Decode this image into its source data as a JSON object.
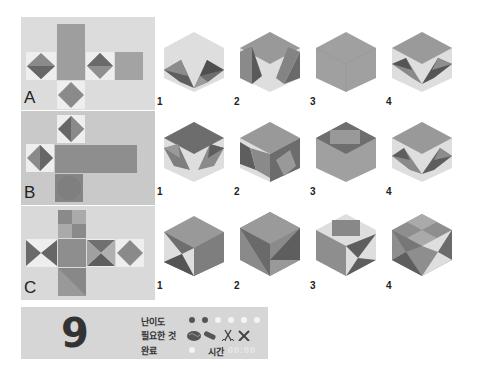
{
  "puzzles": [
    {
      "label": "A",
      "options": [
        "1",
        "2",
        "3",
        "4"
      ]
    },
    {
      "label": "B",
      "options": [
        "1",
        "2",
        "3",
        "4"
      ]
    },
    {
      "label": "C",
      "options": [
        "1",
        "2",
        "3",
        "4"
      ]
    }
  ],
  "info": {
    "number": "9",
    "difficulty_label": "난이도",
    "difficulty_filled": 2,
    "difficulty_total": 6,
    "required_label": "필요한 것",
    "required_items": [
      "brain-icon",
      "pencil-icon",
      "scissors-icon",
      "tools-icon"
    ],
    "done_label": "완료",
    "time_label": "시간",
    "time_value": "00:00"
  },
  "colors": {
    "light": "#dedede",
    "mid": "#9e9e9e",
    "dark": "#6f6f6f",
    "darker": "#5a5a5a",
    "panel_a": "#dcdcdc",
    "panel_b": "#c9c9c9",
    "panel_c": "#d9d9d9"
  }
}
